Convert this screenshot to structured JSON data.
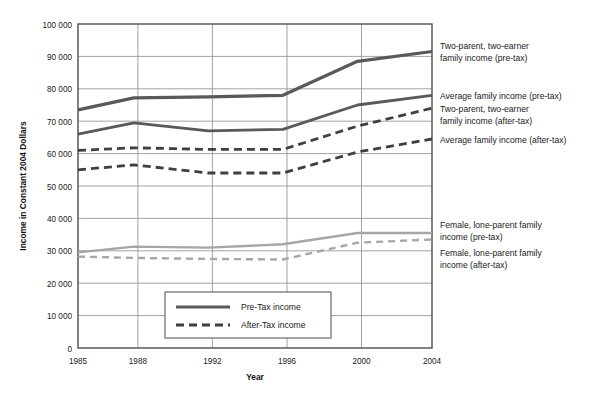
{
  "chart_data": {
    "type": "line",
    "title": "",
    "xlabel": "Year",
    "ylabel": "Income in Constant 2004 Dollars",
    "x": [
      1985,
      1988,
      1992,
      1996,
      2000,
      2004
    ],
    "categories": [
      "1985",
      "1988",
      "1992",
      "1996",
      "2000",
      "2004"
    ],
    "xlim": [
      1985,
      2004
    ],
    "ylim": [
      0,
      100000
    ],
    "yticks": [
      0,
      10000,
      20000,
      30000,
      40000,
      50000,
      60000,
      70000,
      80000,
      90000,
      100000
    ],
    "ytick_labels": [
      "0",
      "10 000",
      "20 000",
      "30 000",
      "40 000",
      "50 000",
      "60 000",
      "70 000",
      "80 000",
      "90 000",
      "100 000"
    ],
    "xtick_labels": [
      "1985",
      "1988",
      "1992",
      "1996",
      "2000",
      "2004"
    ],
    "grid": "horizontal-and-vertical",
    "legend_position": "inside-bottom-center",
    "series": [
      {
        "name": "Two-parent, two-earner family income (pre-tax)",
        "style": "solid",
        "color": "#595959",
        "values": [
          73500,
          77200,
          77500,
          78000,
          88500,
          91500
        ],
        "label_x": 440,
        "label_y": 46
      },
      {
        "name": "Average family income (pre-tax)",
        "style": "solid",
        "color": "#595959",
        "values": [
          66000,
          69500,
          67000,
          67500,
          75000,
          78000
        ],
        "label_x": 440,
        "label_y": 101
      },
      {
        "name": "Two-parent, two-earner family income (after-tax)",
        "style": "dashed",
        "color": "#3f3f3f",
        "values": [
          61000,
          61800,
          61300,
          61300,
          68500,
          74000
        ],
        "label_x": 440,
        "label_y": 114
      },
      {
        "name": "Average family income (after-tax)",
        "style": "dashed",
        "color": "#3f3f3f",
        "values": [
          55000,
          56500,
          54000,
          54000,
          60500,
          64500
        ],
        "label_x": 440,
        "label_y": 147
      },
      {
        "name": "Female, lone-parent family income (pre-tax)",
        "style": "solid",
        "color": "#a6a6a6",
        "values": [
          29500,
          31300,
          31000,
          32000,
          35500,
          35500
        ],
        "label_x": 440,
        "label_y": 230
      },
      {
        "name": "Female, lone-parent family income (after-tax)",
        "style": "dashed",
        "color": "#a6a6a6",
        "values": [
          28200,
          27800,
          27500,
          27300,
          32500,
          33500
        ],
        "label_x": 440,
        "label_y": 255
      }
    ],
    "legend": [
      {
        "label": "Pre-Tax income",
        "style": "solid",
        "color": "#595959"
      },
      {
        "label": "After-Tax income",
        "style": "dashed",
        "color": "#3f3f3f"
      }
    ],
    "callouts": [
      {
        "id": "callout-two-parent-pretax",
        "lines": [
          "Two-parent, two-earner",
          "family income (pre-tax)"
        ]
      },
      {
        "id": "callout-average-pretax",
        "lines": [
          "Average family income (pre-tax)"
        ]
      },
      {
        "id": "callout-two-parent-aftertax",
        "lines": [
          "Two-parent, two-earner",
          "family income (after-tax)"
        ]
      },
      {
        "id": "callout-average-aftertax",
        "lines": [
          "Average family income (after-tax)"
        ]
      },
      {
        "id": "callout-lone-parent-pretax",
        "lines": [
          "Female, lone-parent family",
          "income (pre-tax)"
        ]
      },
      {
        "id": "callout-lone-parent-aftertax",
        "lines": [
          "Female, lone-parent family",
          "income (after-tax)"
        ]
      }
    ]
  },
  "axis": {
    "y_title": "Income in Constant 2004 Dollars",
    "x_title": "Year",
    "y_labels": {
      "t100": "100 000",
      "t90": "90 000",
      "t80": "80 000",
      "t70": "70 000",
      "t60": "60 000",
      "t50": "50 000",
      "t40": "40 000",
      "t30": "30 000",
      "t20": "20 000",
      "t10": "10 000",
      "t0": "0"
    },
    "x_labels": {
      "x1985": "1985",
      "x1988": "1988",
      "x1992": "1992",
      "x1996": "1996",
      "x2000": "2000",
      "x2004": "2004"
    }
  },
  "legend": {
    "pre_tax": "Pre-Tax income",
    "after_tax": "After-Tax income"
  },
  "callouts": {
    "two_parent_pretax_l1": "Two-parent, two-earner",
    "two_parent_pretax_l2": "family income (pre-tax)",
    "average_pretax_l1": "Average family income (pre-tax)",
    "two_parent_aftertax_l1": "Two-parent, two-earner",
    "two_parent_aftertax_l2": "family income (after-tax)",
    "average_aftertax_l1": "Average family income (after-tax)",
    "lone_parent_pretax_l1": "Female, lone-parent family",
    "lone_parent_pretax_l2": "income (pre-tax)",
    "lone_parent_aftertax_l1": "Female, lone-parent family",
    "lone_parent_aftertax_l2": "income (after-tax)"
  },
  "colors": {
    "dark_line": "#595959",
    "dashed_line": "#3f3f3f",
    "light_line": "#a6a6a6",
    "grid": "#8c8c8c",
    "frame": "#4d4d4d",
    "background": "#ffffff"
  }
}
